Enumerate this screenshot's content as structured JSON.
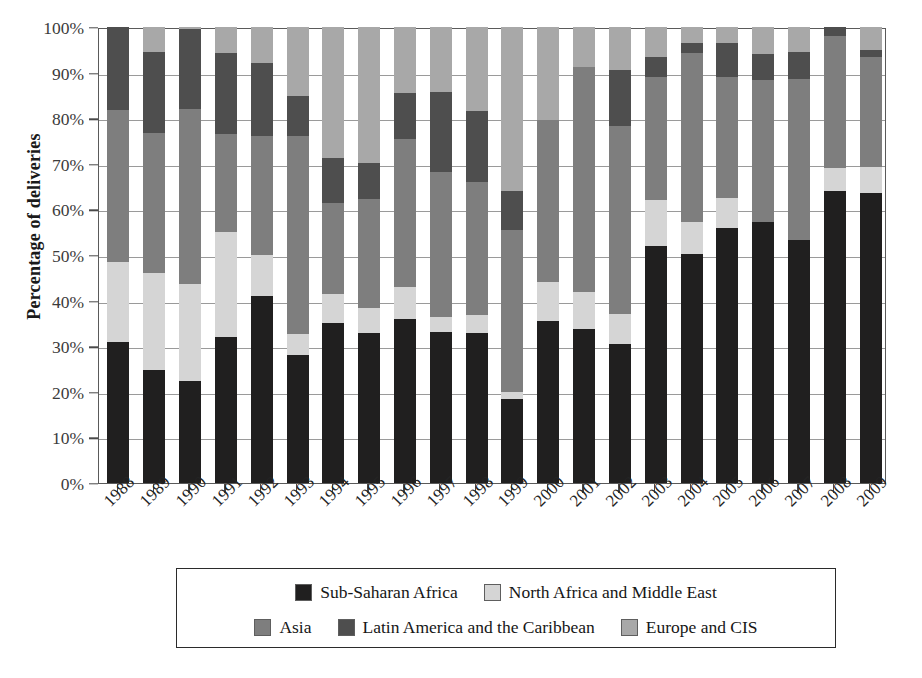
{
  "chart_data": {
    "type": "bar",
    "subtype": "stacked-bar-100-percent",
    "title": "",
    "xlabel": "",
    "ylabel": "Percentage of deliveries",
    "ylim": [
      0,
      100
    ],
    "yticks": [
      "0%",
      "10%",
      "20%",
      "30%",
      "40%",
      "50%",
      "60%",
      "70%",
      "80%",
      "90%",
      "100%"
    ],
    "ytick_values": [
      0,
      10,
      20,
      30,
      40,
      50,
      60,
      70,
      80,
      90,
      100
    ],
    "grid": true,
    "legend_position": "bottom",
    "categories": [
      "1988",
      "1989",
      "1990",
      "1991",
      "1992",
      "1993",
      "1994",
      "1995",
      "1996",
      "1997",
      "1998",
      "1999",
      "2000",
      "2001",
      "2002",
      "2003",
      "2004",
      "2005",
      "2006",
      "2007",
      "2008",
      "2009"
    ],
    "series": [
      {
        "name": "Sub-Saharan Africa",
        "color": "#201f1f",
        "values": [
          31.0,
          24.8,
          22.4,
          32.0,
          41.0,
          28.0,
          35.0,
          33.0,
          36.0,
          33.2,
          33.0,
          18.5,
          35.5,
          33.8,
          30.5,
          52.0,
          50.2,
          56.0,
          57.3,
          53.3,
          64.0,
          63.5
        ]
      },
      {
        "name": "North Africa and Middle East",
        "color": "#d5d5d5",
        "values": [
          17.5,
          21.3,
          21.3,
          23.0,
          9.0,
          4.7,
          6.5,
          5.3,
          7.0,
          3.3,
          3.8,
          1.5,
          8.5,
          8.0,
          6.5,
          10.0,
          7.0,
          6.5,
          0.0,
          0.0,
          5.0,
          5.8
        ]
      },
      {
        "name": "Asia",
        "color": "#7e7e7e",
        "values": [
          33.3,
          30.6,
          38.3,
          21.5,
          26.0,
          43.5,
          20.0,
          24.0,
          32.5,
          31.8,
          29.2,
          35.5,
          35.7,
          49.5,
          41.2,
          27.0,
          37.0,
          26.5,
          31.0,
          35.2,
          29.0,
          24.2
        ]
      },
      {
        "name": "Latin America and the Caribbean",
        "color": "#4e4e4e",
        "values": [
          18.2,
          17.8,
          17.5,
          17.7,
          16.2,
          8.7,
          9.8,
          7.9,
          10.0,
          17.4,
          15.5,
          8.5,
          0.0,
          0.0,
          12.3,
          4.5,
          2.2,
          7.5,
          5.8,
          6.0,
          2.0,
          1.4
        ]
      },
      {
        "name": "Europe and CIS",
        "color": "#a8a8a8",
        "values": [
          0.0,
          5.5,
          0.5,
          5.8,
          7.8,
          15.1,
          28.7,
          29.8,
          14.5,
          14.3,
          18.5,
          36.0,
          20.3,
          8.7,
          9.5,
          6.5,
          3.6,
          3.5,
          5.9,
          5.5,
          0.0,
          5.1
        ]
      }
    ]
  },
  "axis": {
    "ylabel": "Percentage of deliveries"
  },
  "legend": {
    "rows": [
      [
        {
          "label": "Sub-Saharan Africa",
          "color": "#201f1f"
        },
        {
          "label": "North Africa and Middle East",
          "color": "#d5d5d5"
        }
      ],
      [
        {
          "label": "Asia",
          "color": "#7e7e7e"
        },
        {
          "label": "Latin America and the Caribbean",
          "color": "#4e4e4e"
        },
        {
          "label": "Europe and CIS",
          "color": "#a8a8a8"
        }
      ]
    ]
  }
}
